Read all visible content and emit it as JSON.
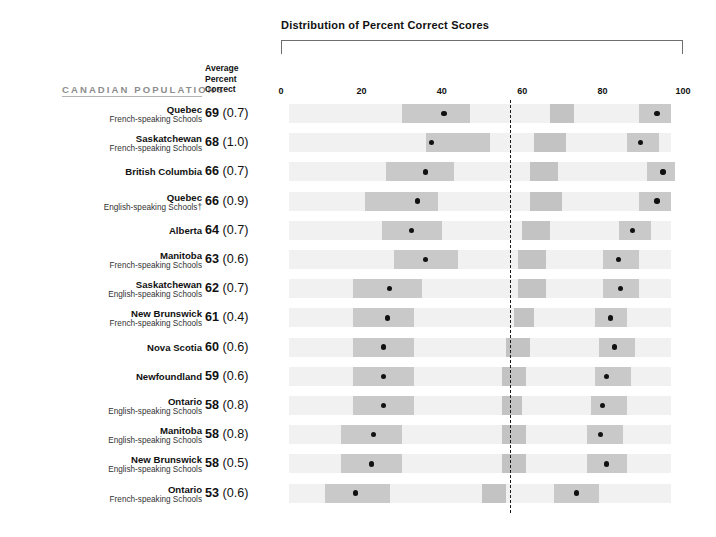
{
  "chart_data": {
    "type": "bar",
    "title": "Distribution of Percent Correct Scores",
    "subtitle": "",
    "xlabel": "",
    "ylabel": "",
    "xlim": [
      0,
      100
    ],
    "xticks": [
      0,
      20,
      40,
      60,
      80,
      100
    ],
    "grid": false,
    "legend": false,
    "reference_line": 57,
    "columns": {
      "populations": "CANADIAN POPULATIONS",
      "average_line1": "Average",
      "average_line2": "Percent",
      "average_line3": "Correct"
    },
    "footnote_marker": "†",
    "categories": [
      "Quebec French-speaking Schools",
      "Saskatchewan French-speaking Schools",
      "British Columbia",
      "Quebec English-speaking Schools†",
      "Alberta",
      "Manitoba French-speaking Schools",
      "Saskatchewan English-speaking Schools",
      "New Brunswick French-speaking Schools",
      "Nova Scotia",
      "Newfoundland",
      "Ontario English-speaking Schools",
      "Manitoba English-speaking Schools",
      "New Brunswick English-speaking Schools",
      "Ontario French-speaking Schools"
    ],
    "values": [
      69,
      68,
      66,
      66,
      64,
      63,
      62,
      61,
      60,
      59,
      58,
      58,
      58,
      53
    ],
    "standard_errors": [
      0.7,
      1.0,
      0.7,
      0.9,
      0.7,
      0.6,
      0.7,
      0.4,
      0.6,
      0.6,
      0.8,
      0.8,
      0.5,
      0.6
    ],
    "rows": [
      {
        "name": "Quebec",
        "sub": "French-speaking Schools",
        "mean": "69",
        "se": "(0.7)",
        "band": [
          2,
          97
        ],
        "segments": [
          [
            30,
            47
          ],
          [
            67,
            73
          ],
          [
            89,
            97
          ]
        ],
        "dots": [
          40.5,
          93.5
        ]
      },
      {
        "name": "Saskatchewan",
        "sub": "French-speaking Schools",
        "mean": "68",
        "se": "(1.0)",
        "band": [
          2,
          97
        ],
        "segments": [
          [
            36,
            52
          ],
          [
            63,
            71
          ],
          [
            86,
            94
          ]
        ],
        "dots": [
          37.5,
          89.5
        ]
      },
      {
        "name": "British Columbia",
        "sub": "",
        "mean": "66",
        "se": "(0.7)",
        "band": [
          2,
          97
        ],
        "segments": [
          [
            26,
            43
          ],
          [
            62,
            69
          ],
          [
            91,
            98
          ]
        ],
        "dots": [
          36.0,
          95.0
        ]
      },
      {
        "name": "Quebec",
        "sub": "English-speaking Schools†",
        "mean": "66",
        "se": "(0.9)",
        "band": [
          2,
          97
        ],
        "segments": [
          [
            21,
            39
          ],
          [
            62,
            70
          ],
          [
            89,
            97
          ]
        ],
        "dots": [
          34.0,
          93.5
        ]
      },
      {
        "name": "Alberta",
        "sub": "",
        "mean": "64",
        "se": "(0.7)",
        "band": [
          2,
          97
        ],
        "segments": [
          [
            25,
            40
          ],
          [
            60,
            67
          ],
          [
            84,
            92
          ]
        ],
        "dots": [
          32.5,
          87.5
        ]
      },
      {
        "name": "Manitoba",
        "sub": "French-speaking Schools",
        "mean": "63",
        "se": "(0.6)",
        "band": [
          2,
          97
        ],
        "segments": [
          [
            28,
            44
          ],
          [
            59,
            66
          ],
          [
            80,
            89
          ]
        ],
        "dots": [
          36.0,
          84.0
        ]
      },
      {
        "name": "Saskatchewan",
        "sub": "English-speaking Schools",
        "mean": "62",
        "se": "(0.7)",
        "band": [
          2,
          97
        ],
        "segments": [
          [
            18,
            35
          ],
          [
            59,
            66
          ],
          [
            80,
            89
          ]
        ],
        "dots": [
          27.0,
          84.5
        ]
      },
      {
        "name": "New Brunswick",
        "sub": "French-speaking Schools",
        "mean": "61",
        "se": "(0.4)",
        "band": [
          2,
          97
        ],
        "segments": [
          [
            18,
            33
          ],
          [
            58,
            63
          ],
          [
            78,
            86
          ]
        ],
        "dots": [
          26.5,
          82.0
        ]
      },
      {
        "name": "Nova Scotia",
        "sub": "",
        "mean": "60",
        "se": "(0.6)",
        "band": [
          2,
          97
        ],
        "segments": [
          [
            18,
            33
          ],
          [
            56,
            62
          ],
          [
            79,
            88
          ]
        ],
        "dots": [
          25.5,
          83.0
        ]
      },
      {
        "name": "Newfoundland",
        "sub": "",
        "mean": "59",
        "se": "(0.6)",
        "band": [
          2,
          97
        ],
        "segments": [
          [
            18,
            33
          ],
          [
            55,
            61
          ],
          [
            78,
            87
          ]
        ],
        "dots": [
          25.5,
          81.0
        ]
      },
      {
        "name": "Ontario",
        "sub": "English-speaking Schools",
        "mean": "58",
        "se": "(0.8)",
        "band": [
          2,
          97
        ],
        "segments": [
          [
            18,
            33
          ],
          [
            55,
            60
          ],
          [
            77,
            86
          ]
        ],
        "dots": [
          25.5,
          80.0
        ]
      },
      {
        "name": "Manitoba",
        "sub": "English-speaking Schools",
        "mean": "58",
        "se": "(0.8)",
        "band": [
          2,
          97
        ],
        "segments": [
          [
            15,
            30
          ],
          [
            55,
            61
          ],
          [
            76,
            85
          ]
        ],
        "dots": [
          23.0,
          79.5
        ]
      },
      {
        "name": "New Brunswick",
        "sub": "English-speaking Schools",
        "mean": "58",
        "se": "(0.5)",
        "band": [
          2,
          97
        ],
        "segments": [
          [
            15,
            30
          ],
          [
            55,
            61
          ],
          [
            76,
            86
          ]
        ],
        "dots": [
          22.5,
          81.0
        ]
      },
      {
        "name": "Ontario",
        "sub": "French-speaking Schools",
        "mean": "53",
        "se": "(0.6)",
        "band": [
          2,
          97
        ],
        "segments": [
          [
            11,
            27
          ],
          [
            50,
            56
          ],
          [
            68,
            79
          ]
        ],
        "dots": [
          18.5,
          73.5
        ]
      }
    ]
  }
}
